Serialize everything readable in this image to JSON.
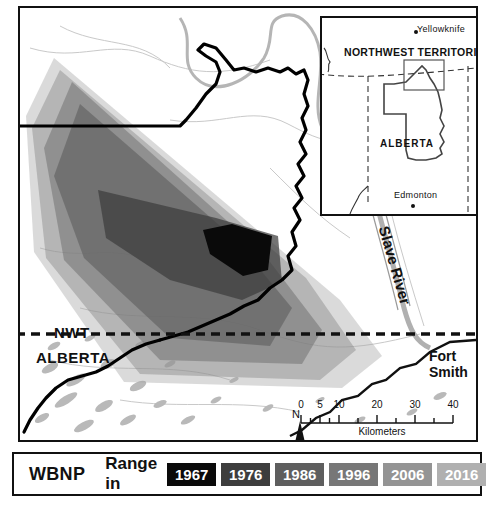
{
  "map": {
    "title": "Wood Buffalo National Park bison range map",
    "labels": {
      "nwt": "NWT",
      "alberta": "ALBERTA",
      "fort_smith": "Fort Smith",
      "slave_river": "Slave River"
    }
  },
  "inset": {
    "labels": {
      "northwest_territories": "NORTHWEST TERRITORIES",
      "alberta": "ALBERTA",
      "yellowknife": "Yellowknife",
      "edmonton": "Edmonton"
    }
  },
  "scalebar": {
    "ticks": [
      "0",
      "5",
      "10",
      "20",
      "30",
      "40"
    ],
    "tick_positions": [
      0,
      19,
      38,
      76,
      114,
      152
    ],
    "units": "Kilometers"
  },
  "north_arrow": {
    "label": "N"
  },
  "legend": {
    "park_label": "WBNP",
    "range_label": "Range in",
    "swatches": [
      {
        "year": "1967",
        "color": "#0a0a0a"
      },
      {
        "year": "1976",
        "color": "#3d3d3d"
      },
      {
        "year": "1986",
        "color": "#5e5e5e"
      },
      {
        "year": "1996",
        "color": "#777777"
      },
      {
        "year": "2006",
        "color": "#949494"
      },
      {
        "year": "2016",
        "color": "#b0b0b0"
      }
    ]
  },
  "chart_data": {
    "type": "map",
    "series": [
      {
        "name": "1967",
        "color": "#0a0a0a",
        "opacity": 1.0,
        "polygon": "212,216 252,228 248,262 223,268 190,246 183,222"
      },
      {
        "name": "1976",
        "color": "#3d3d3d",
        "opacity": 0.72,
        "polygon": "78,182 196,210 258,228 262,274 222,292 150,272 86,230"
      },
      {
        "name": "1986",
        "color": "#5e5e5e",
        "opacity": 0.6,
        "polygon": "60,96 214,230 272,300 250,338 150,330 64,250 34,168"
      },
      {
        "name": "1996",
        "color": "#6f6f6f",
        "opacity": 0.52,
        "polygon": "52,74 244,246 302,322 282,356 140,352 44,252 24,140"
      },
      {
        "name": "2006",
        "color": "#8a8a8a",
        "opacity": 0.46,
        "polygon": "40,62 286,270 336,342 300,372 120,366 26,250 12,120"
      },
      {
        "name": "2016",
        "color": "#a8a8a8",
        "opacity": 0.42,
        "polygon": "34,50 320,292 362,348 322,380 104,374 14,244 6,108"
      }
    ],
    "legend_position": "bottom",
    "grid": false
  }
}
